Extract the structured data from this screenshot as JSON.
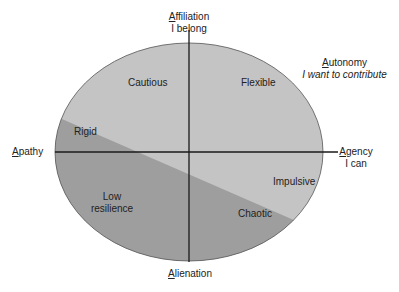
{
  "diagram": {
    "axes": {
      "top": {
        "title_first": "A",
        "title_rest": "ffiliation",
        "subtitle": "I belong"
      },
      "right": {
        "title_first": "A",
        "title_rest": "gency",
        "subtitle": "I can"
      },
      "bottom": {
        "title_first": "A",
        "title_rest": "lienation"
      },
      "left": {
        "title_first": "A",
        "title_rest": "pathy"
      },
      "diagonal": {
        "title_first": "A",
        "title_rest": "utonomy",
        "subtitle": "I want to contribute"
      }
    },
    "regions": {
      "cautious": "Cautious",
      "flexible": "Flexible",
      "rigid": "Rigid",
      "impulsive": "Impulsive",
      "low_resilience_1": "Low",
      "low_resilience_2": "resilience",
      "chaotic": "Chaotic"
    },
    "colors": {
      "light": "#c4c4c4",
      "dark": "#9e9e9e",
      "line": "#1a1a1a"
    }
  }
}
